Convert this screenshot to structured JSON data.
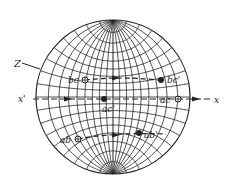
{
  "figure": {
    "type": "wulff-net-stereographic-projection",
    "axes": {
      "z_label": "Z",
      "x_prime_label": "x'",
      "x_label": "x"
    },
    "paths": [
      {
        "id": "bc",
        "start_label": "bc",
        "end_label": "bc'",
        "start_marker": "open-circle-cross",
        "end_marker": "filled-dot"
      },
      {
        "id": "ac",
        "start_label": "ac'",
        "end_label": "ac",
        "start_marker": "filled-dot",
        "end_marker": "open-circle-cross"
      },
      {
        "id": "ab",
        "start_label": "ab",
        "end_label": "ab'",
        "start_marker": "open-circle-cross",
        "end_marker": "filled-dot"
      }
    ],
    "colors": {
      "ink": "#222222",
      "background": "#ffffff"
    }
  }
}
